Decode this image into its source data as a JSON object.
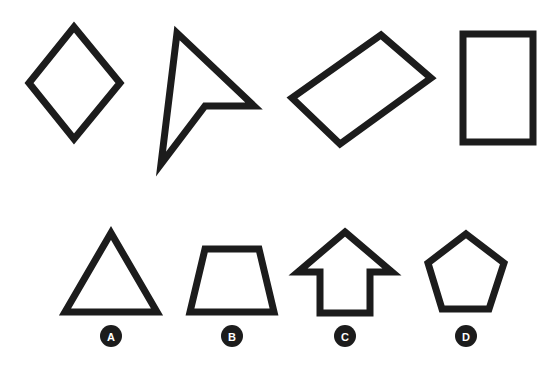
{
  "canvas": {
    "width": 557,
    "height": 365,
    "background_color": "#ffffff",
    "stroke_color": "#1c1c1c",
    "badge_fill_color": "#1c1c1c",
    "badge_text_color": "#ffffff",
    "stroke_width": 7
  },
  "prompt_row": {
    "name": "reference-shapes",
    "shapes": [
      {
        "id": "shape-rhombus",
        "icon_name": "rhombus-icon",
        "label": "rhombus",
        "sides": 4,
        "points": "74,27 120,83 74,139 29,83"
      },
      {
        "id": "shape-cursor-arrow",
        "icon_name": "cursor-arrow-icon",
        "label": "cursor arrow",
        "sides": 4,
        "points": "177,33 254,106 205,106 161,164"
      },
      {
        "id": "shape-tilted-rectangle",
        "icon_name": "tilted-rectangle-icon",
        "label": "tilted rectangle",
        "sides": 4,
        "points": "381,35 431,78 340,144 292,98"
      },
      {
        "id": "shape-upright-rectangle",
        "icon_name": "rectangle-icon",
        "label": "upright rectangle",
        "sides": 4,
        "points": "463,34 533,34 533,142 463,142"
      }
    ]
  },
  "answer_row": {
    "name": "answer-options",
    "options": [
      {
        "id": "option-a",
        "letter": "A",
        "icon_name": "triangle-icon",
        "label": "triangle",
        "sides": 3,
        "points": "111,233 157,312 65,312",
        "badge_x": 111,
        "badge_y": 336
      },
      {
        "id": "option-b",
        "letter": "B",
        "icon_name": "trapezoid-icon",
        "label": "trapezoid",
        "sides": 4,
        "points": "205,249 259,249 274,312 190,312",
        "badge_x": 232,
        "badge_y": 336
      },
      {
        "id": "option-c",
        "letter": "C",
        "icon_name": "up-arrow-icon",
        "label": "up arrow",
        "sides": 7,
        "points": "345,232 392,272 370,272 370,313 320,313 320,272 298,272",
        "badge_x": 345,
        "badge_y": 336
      },
      {
        "id": "option-d",
        "letter": "D",
        "icon_name": "pentagon-icon",
        "label": "pentagon",
        "sides": 5,
        "points": "466,234 504,263 489,309 442,309 428,263",
        "badge_x": 466,
        "badge_y": 336
      }
    ]
  }
}
